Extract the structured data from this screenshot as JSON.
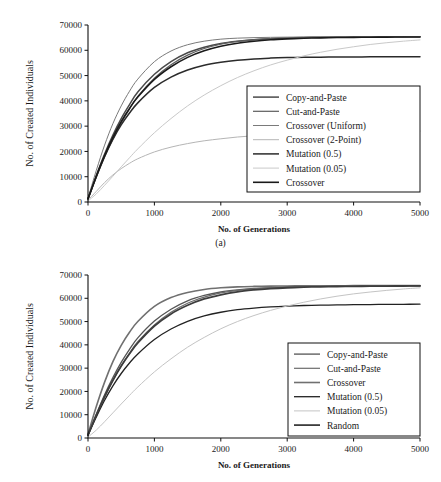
{
  "figures": [
    {
      "id": "a",
      "caption": "(a)",
      "chart_data": {
        "type": "line",
        "title": "",
        "xlabel": "No. of Generations",
        "ylabel": "No. of Created Individuals",
        "xlim": [
          0,
          5000
        ],
        "ylim": [
          0,
          70000
        ],
        "xticks": [
          0,
          1000,
          2000,
          3000,
          4000,
          5000
        ],
        "yticks": [
          0,
          10000,
          20000,
          30000,
          40000,
          50000,
          60000,
          70000
        ],
        "xtick_labels": [
          "0",
          "1000",
          "2000",
          "3000",
          "4000",
          "5000"
        ],
        "ytick_labels": [
          "0",
          "10000",
          "20000",
          "30000",
          "40000",
          "50000",
          "60000",
          "70000"
        ],
        "grid": false,
        "legend_position": "lower-right",
        "x": [
          0,
          125,
          250,
          375,
          500,
          625,
          750,
          1000,
          1250,
          1500,
          1750,
          2000,
          2250,
          2500,
          2750,
          3000,
          3250,
          3500,
          3750,
          4000,
          4250,
          4500,
          4750,
          5000
        ],
        "series": [
          {
            "name": "Copy-and-Paste",
            "color": "#4a4a4a",
            "width": 1.5,
            "values": [
              1200,
              10500,
              19000,
              26500,
              33000,
              38500,
              43500,
              50500,
              55500,
              59000,
              61200,
              62700,
              63600,
              64200,
              64600,
              64850,
              65000,
              65100,
              65180,
              65230,
              65270,
              65300,
              65320,
              65340
            ]
          },
          {
            "name": "Cut-and-Paste",
            "color": "#5c5c5c",
            "width": 1.2,
            "values": [
              1100,
              9800,
              17800,
              25000,
              31300,
              36800,
              41800,
              49000,
              54300,
              58100,
              60700,
              62400,
              63500,
              64200,
              64650,
              64950,
              65120,
              65230,
              65300,
              65350,
              65390,
              65420,
              65440,
              65460
            ]
          },
          {
            "name": "Crossover (Uniform)",
            "color": "#7a7a7a",
            "width": 1.0,
            "values": [
              1500,
              12500,
              22500,
              31000,
              38000,
              43800,
              48600,
              55500,
              59700,
              62200,
              63600,
              64400,
              64800,
              65000,
              65120,
              65200,
              65260,
              65300,
              65330,
              65350,
              65370,
              65380,
              65390,
              65400
            ]
          },
          {
            "name": "Crossover (2-Point)",
            "color": "#b5b5b5",
            "width": 1.0,
            "values": [
              700,
              4200,
              7700,
              10700,
              13200,
              15300,
              17100,
              19800,
              21700,
              23100,
              24200,
              25000,
              25700,
              26200,
              26600,
              26900,
              27200,
              27400,
              27600,
              27750,
              27850,
              27950,
              28000,
              28050
            ]
          },
          {
            "name": "Mutation (0.5)",
            "color": "#2b2b2b",
            "width": 1.5,
            "values": [
              1300,
              10000,
              18000,
              24800,
              30500,
              35200,
              39200,
              45300,
              49400,
              52200,
              54100,
              55300,
              56100,
              56600,
              56900,
              57100,
              57200,
              57280,
              57330,
              57370,
              57400,
              57420,
              57440,
              57450
            ]
          },
          {
            "name": "Mutation (0.05)",
            "color": "#c9c9c9",
            "width": 1.0,
            "values": [
              400,
              3200,
              6600,
              10200,
              13900,
              17500,
              21000,
              27400,
              33000,
              38000,
              42300,
              46000,
              49200,
              51900,
              54200,
              56100,
              57800,
              59200,
              60400,
              61400,
              62300,
              63000,
              63600,
              64100
            ]
          },
          {
            "name": "Crossover",
            "color": "#1a1a1a",
            "width": 1.6,
            "values": [
              1250,
              10200,
              18400,
              25600,
              31800,
              37000,
              41500,
              48500,
              53500,
              57200,
              59800,
              61600,
              62800,
              63600,
              64150,
              64500,
              64750,
              64920,
              65030,
              65110,
              65170,
              65210,
              65240,
              65260
            ]
          }
        ]
      }
    },
    {
      "id": "b",
      "caption": "",
      "chart_data": {
        "type": "line",
        "title": "",
        "xlabel": "No. of Generations",
        "ylabel": "No. of Created Individuals",
        "xlim": [
          0,
          5000
        ],
        "ylim": [
          0,
          70000
        ],
        "xticks": [
          0,
          1000,
          2000,
          3000,
          4000,
          5000
        ],
        "yticks": [
          0,
          10000,
          20000,
          30000,
          40000,
          50000,
          60000,
          70000
        ],
        "xtick_labels": [
          "0",
          "1000",
          "2000",
          "3000",
          "4000",
          "5000"
        ],
        "ytick_labels": [
          "0",
          "10000",
          "20000",
          "30000",
          "40000",
          "50000",
          "60000",
          "70000"
        ],
        "grid": false,
        "legend_position": "lower-right",
        "x": [
          0,
          125,
          250,
          375,
          500,
          625,
          750,
          1000,
          1250,
          1500,
          1750,
          2000,
          2250,
          2500,
          2750,
          3000,
          3250,
          3500,
          3750,
          4000,
          4250,
          4500,
          4750,
          5000
        ],
        "series": [
          {
            "name": "Copy-and-Paste",
            "color": "#555555",
            "width": 1.3,
            "values": [
              1200,
              10200,
              18600,
              26000,
              32500,
              38100,
              43000,
              50200,
              55300,
              58900,
              61200,
              62700,
              63600,
              64200,
              64600,
              64850,
              65020,
              65130,
              65210,
              65270,
              65310,
              65340,
              65360,
              65380
            ]
          },
          {
            "name": "Cut-and-Paste",
            "color": "#6b6b6b",
            "width": 1.2,
            "values": [
              1100,
              9600,
              17500,
              24600,
              30900,
              36400,
              41400,
              48600,
              54000,
              57900,
              60500,
              62300,
              63400,
              64100,
              64600,
              64900,
              65100,
              65220,
              65300,
              65360,
              65400,
              65430,
              65450,
              65470
            ]
          },
          {
            "name": "Crossover",
            "color": "#707070",
            "width": 1.6,
            "values": [
              1600,
              13500,
              24000,
              32800,
              39800,
              45400,
              50000,
              56500,
              60300,
              62500,
              63800,
              64500,
              64900,
              65100,
              65220,
              65290,
              65340,
              65370,
              65400,
              65420,
              65440,
              65450,
              65460,
              65470
            ]
          },
          {
            "name": "Mutation (0.5)",
            "color": "#222222",
            "width": 1.3,
            "values": [
              1300,
              9000,
              16200,
              22400,
              27700,
              32200,
              36100,
              42300,
              46800,
              50100,
              52400,
              54000,
              55100,
              55800,
              56300,
              56650,
              56900,
              57050,
              57150,
              57250,
              57320,
              57380,
              57420,
              57450
            ]
          },
          {
            "name": "Mutation (0.05)",
            "color": "#c4c4c4",
            "width": 1.0,
            "values": [
              400,
              3400,
              7000,
              10800,
              14600,
              18300,
              21900,
              28400,
              34000,
              39000,
              43200,
              46900,
              50000,
              52600,
              54800,
              56700,
              58300,
              59700,
              60900,
              61900,
              62700,
              63400,
              64000,
              64500
            ]
          },
          {
            "name": "Random",
            "color": "#3d3d3d",
            "width": 1.8,
            "values": [
              1250,
              9800,
              17800,
              24800,
              30900,
              36200,
              40800,
              48100,
              53300,
              57000,
              59700,
              61500,
              62800,
              63600,
              64150,
              64520,
              64770,
              64940,
              65060,
              65140,
              65200,
              65250,
              65280,
              65310
            ]
          }
        ]
      }
    }
  ]
}
